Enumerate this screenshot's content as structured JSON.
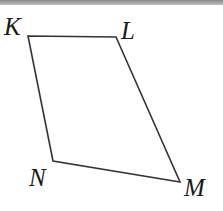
{
  "figure": {
    "shape": "quadrilateral",
    "vertices": [
      {
        "name": "K",
        "x": 28,
        "y": 36,
        "label_x": 4,
        "label_y": 35
      },
      {
        "name": "L",
        "x": 116,
        "y": 37,
        "label_x": 121,
        "label_y": 39
      },
      {
        "name": "M",
        "x": 180,
        "y": 182,
        "label_x": 184,
        "label_y": 196
      },
      {
        "name": "N",
        "x": 53,
        "y": 161,
        "label_x": 29,
        "label_y": 186
      }
    ],
    "stroke_color": "#333333"
  }
}
